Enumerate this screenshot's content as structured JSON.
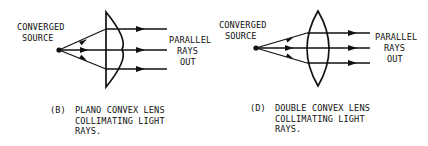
{
  "colors": {
    "ink": "#111111",
    "background": "#ffffff"
  },
  "diagrams": [
    {
      "id": "B",
      "lens_type": "plano-convex",
      "source_label": {
        "line1": "CONVERGED",
        "line2": "SOURCE"
      },
      "output_label": {
        "line1": "PARALLEL",
        "line2": "RAYS",
        "line3": "OUT"
      },
      "caption": {
        "tag": "(B)",
        "line1": "PLANO CONVEX LENS",
        "line2": "COLLIMATING LIGHT",
        "line3": "RAYS."
      }
    },
    {
      "id": "D",
      "lens_type": "double-convex",
      "source_label": {
        "line1": "CONVERGED",
        "line2": "SOURCE"
      },
      "output_label": {
        "line1": "PARALLEL",
        "line2": "RAYS",
        "line3": "OUT"
      },
      "caption": {
        "tag": "(D)",
        "line1": "DOUBLE CONVEX LENS",
        "line2": "COLLIMATING LIGHT",
        "line3": "RAYS."
      }
    }
  ]
}
